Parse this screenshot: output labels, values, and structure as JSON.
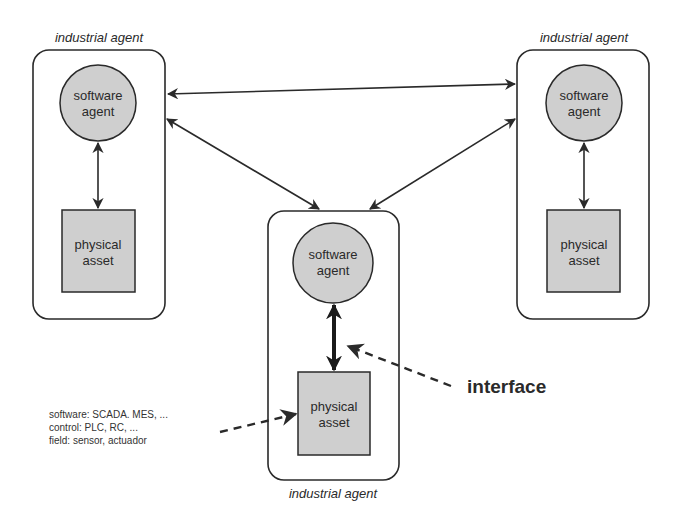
{
  "diagram": {
    "agents": [
      {
        "id": "left",
        "label": "industrial agent",
        "software_agent": {
          "line1": "software",
          "line2": "agent"
        },
        "physical_asset": {
          "line1": "physical",
          "line2": "asset"
        }
      },
      {
        "id": "right",
        "label": "industrial agent",
        "software_agent": {
          "line1": "software",
          "line2": "agent"
        },
        "physical_asset": {
          "line1": "physical",
          "line2": "asset"
        }
      },
      {
        "id": "center",
        "label": "industrial agent",
        "software_agent": {
          "line1": "software",
          "line2": "agent"
        },
        "physical_asset": {
          "line1": "physical",
          "line2": "asset"
        }
      }
    ],
    "interface_label": "interface",
    "layers_note": [
      "software: SCADA. MES, ...",
      "control: PLC, RC, ...",
      "field: sensor, actuador"
    ],
    "colors": {
      "stroke": "#2a2a2a",
      "node_fill": "#cfcfcf",
      "background": "#ffffff"
    }
  }
}
